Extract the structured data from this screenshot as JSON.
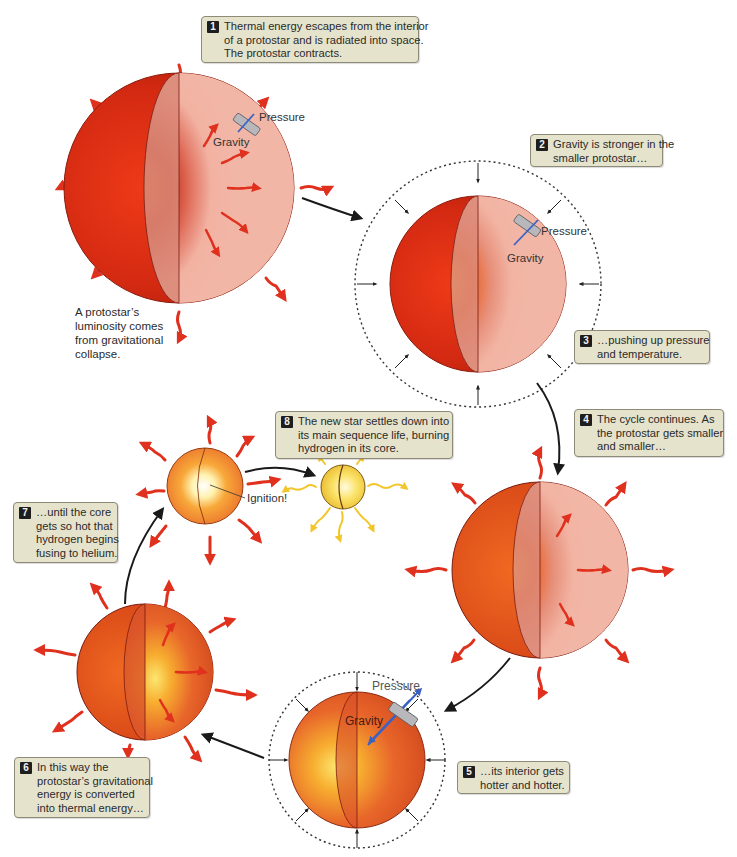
{
  "figure": {
    "colors": {
      "background": "#ffffff",
      "callout_fill": "#e6e3cc",
      "callout_border": "#8d8a78",
      "step_badge": "#1e1e1e",
      "radiation_arrow": "#e0301e",
      "pressure_arrow": "#3a62c4",
      "protostar_outer": "#d42a12",
      "protostar_cut": "#f2b3a2",
      "core_glow": "#f5a623",
      "main_sequence_star": "#f7d547",
      "flow_arrow": "#1a1a1a"
    }
  },
  "callouts": [
    {
      "step": "1",
      "lines": [
        "Thermal energy escapes from the interior",
        "of a protostar and is radiated into space.",
        "The protostar contracts."
      ]
    },
    {
      "step": "2",
      "lines": [
        "Gravity is stronger in the",
        "smaller protostar…"
      ]
    },
    {
      "step": "3",
      "lines": [
        "…pushing up pressure",
        "and temperature."
      ]
    },
    {
      "step": "4",
      "lines": [
        "The cycle continues. As",
        "the protostar gets smaller",
        "and smaller…"
      ]
    },
    {
      "step": "5",
      "lines": [
        "…its interior gets",
        "hotter and hotter."
      ]
    },
    {
      "step": "6",
      "lines": [
        "In this way the",
        "protostar’s gravitational",
        "energy is converted",
        "into thermal energy…"
      ]
    },
    {
      "step": "7",
      "lines": [
        "…until the core",
        "gets so hot that",
        "hydrogen begins",
        "fusing to helium."
      ]
    },
    {
      "step": "8",
      "lines": [
        "The new star settles down into",
        "its main sequence life, burning",
        "hydrogen in its core."
      ]
    }
  ],
  "annotations": {
    "luminosity_note": [
      "A protostar’s",
      "luminosity comes",
      "from gravitational",
      "collapse."
    ],
    "pressure_label": "Pressure",
    "gravity_label": "Gravity",
    "ignition_label": "Ignition!"
  },
  "stages": [
    {
      "id": "large-protostar",
      "label": "Large protostar radiating energy"
    },
    {
      "id": "compressed-protostar",
      "label": "Smaller protostar under pressure"
    },
    {
      "id": "contracting-protostar",
      "label": "Protostar continues contracting"
    },
    {
      "id": "hot-compressed-protostar",
      "label": "Hotter compressed protostar"
    },
    {
      "id": "thermal-protostar",
      "label": "Protostar converting gravitational to thermal energy"
    },
    {
      "id": "igniting-star",
      "label": "Core ignition"
    },
    {
      "id": "main-sequence-star",
      "label": "Main sequence star"
    }
  ]
}
